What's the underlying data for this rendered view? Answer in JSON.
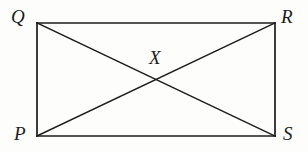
{
  "figure": {
    "type": "geometry-diagram",
    "shape": "rectangle-with-diagonals",
    "background_color": "#fdfdfb",
    "stroke_color": "#1c1c1c",
    "stroke_width": 1.6,
    "vertices": [
      {
        "id": "Q",
        "label": "Q",
        "x": 37,
        "y": 23,
        "position": "top-left"
      },
      {
        "id": "R",
        "label": "R",
        "x": 275,
        "y": 23,
        "position": "top-right"
      },
      {
        "id": "S",
        "label": "S",
        "x": 275,
        "y": 136,
        "position": "bottom-right"
      },
      {
        "id": "P",
        "label": "P",
        "x": 37,
        "y": 136,
        "position": "bottom-left"
      }
    ],
    "intersection": {
      "id": "X",
      "label": "X",
      "x": 156,
      "y": 79.5
    },
    "edges": [
      {
        "name": "QR",
        "from": "Q",
        "to": "R"
      },
      {
        "name": "RS",
        "from": "R",
        "to": "S"
      },
      {
        "name": "SP",
        "from": "S",
        "to": "P"
      },
      {
        "name": "PQ",
        "from": "P",
        "to": "Q"
      }
    ],
    "diagonals": [
      {
        "name": "QS",
        "from": "Q",
        "to": "S"
      },
      {
        "name": "PR",
        "from": "P",
        "to": "R"
      }
    ]
  }
}
